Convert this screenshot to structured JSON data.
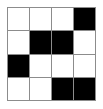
{
  "image": {
    "title": "4x4 black and white grid pattern",
    "width": 103,
    "height": 109,
    "background_color": "#ffffff"
  },
  "grid": {
    "rows": 4,
    "columns": 4,
    "gridline_color": "#8c8c8c",
    "border_color": "#8c8c8c",
    "filled_color": "#000000",
    "empty_color": "#ffffff",
    "filled_label": "black",
    "empty_label": "white",
    "cells": [
      [
        "white",
        "white",
        "white",
        "black"
      ],
      [
        "white",
        "black",
        "black",
        "white"
      ],
      [
        "black",
        "white",
        "white",
        "white"
      ],
      [
        "white",
        "white",
        "black",
        "black"
      ]
    ],
    "filled_count": 7,
    "empty_count": 9
  }
}
